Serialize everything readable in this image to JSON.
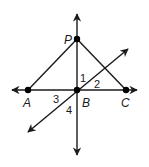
{
  "diagram": {
    "type": "geometry",
    "points": {
      "P": {
        "label": "P",
        "x": 77,
        "y": 39
      },
      "A": {
        "label": "A",
        "x": 28,
        "y": 90
      },
      "B": {
        "label": "B",
        "x": 77,
        "y": 90
      },
      "C": {
        "label": "C",
        "x": 126,
        "y": 90
      }
    },
    "segments": [
      {
        "from": "A",
        "to": "P"
      },
      {
        "from": "P",
        "to": "C"
      }
    ],
    "lines": [
      {
        "name": "vertical-line-PB",
        "x1": 77,
        "y1": 14,
        "x2": 77,
        "y2": 155
      },
      {
        "name": "horizontal-line-AC",
        "x1": 12,
        "y1": 90,
        "x2": 137,
        "y2": 90
      },
      {
        "name": "diagonal-line-through-B",
        "x1": 28,
        "y1": 132,
        "x2": 128,
        "y2": 49
      }
    ],
    "angle_labels": [
      {
        "label": "1",
        "x": 80,
        "y": 82
      },
      {
        "label": "2",
        "x": 94,
        "y": 88
      },
      {
        "label": "3",
        "x": 53,
        "y": 103
      },
      {
        "label": "4",
        "x": 66,
        "y": 114
      }
    ],
    "point_label_positions": {
      "P": {
        "x": 64,
        "y": 44
      },
      "A": {
        "x": 23,
        "y": 107
      },
      "B": {
        "x": 82,
        "y": 107
      },
      "C": {
        "x": 121,
        "y": 107
      }
    },
    "colors": {
      "ink": "#1a1a1a",
      "background": "#ffffff"
    }
  }
}
